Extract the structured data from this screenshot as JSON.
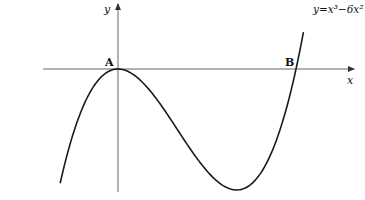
{
  "diagram": {
    "equation_label": "y=x³−6x²",
    "axes": {
      "x_label": "x",
      "y_label": "y"
    },
    "points": [
      {
        "label": "A",
        "x": 0,
        "y": 0
      },
      {
        "label": "B",
        "x": 6,
        "y": 0
      }
    ],
    "curve": {
      "function": "y = x^3 - 6x^2",
      "local_max": {
        "x": 0,
        "y": 0
      },
      "local_min": {
        "x": 4,
        "y": -32
      },
      "x_range": [
        -1.95,
        6.25
      ]
    },
    "colors": {
      "curve": "#1a1a1a",
      "axes": "#555555",
      "text": "#111111"
    }
  }
}
